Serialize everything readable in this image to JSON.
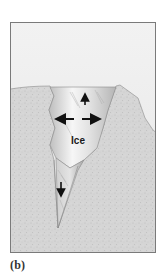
{
  "figure": {
    "caption": "(b)",
    "ice_label": "Ice",
    "arrows": [
      {
        "name": "up-arrow",
        "direction": "up"
      },
      {
        "name": "left-arrow",
        "direction": "left"
      },
      {
        "name": "right-arrow",
        "direction": "right"
      },
      {
        "name": "down-arrow",
        "direction": "down"
      }
    ],
    "colors": {
      "sky": "#ececec",
      "rock": "#d6d6d6",
      "ice_light": "#f4f4f4",
      "ice_dark": "#b9b9b9",
      "frame": "#7a7a7a",
      "arrow": "#111111",
      "text": "#1a1a1a"
    }
  }
}
